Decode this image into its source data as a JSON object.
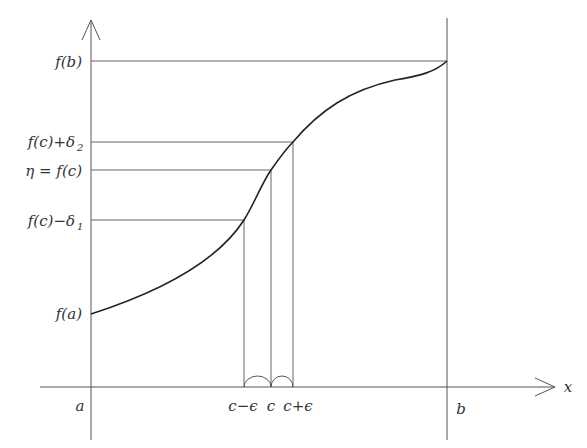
{
  "diagram": {
    "colors": {
      "stroke": "#444444",
      "curve": "#222222",
      "text": "#333333",
      "background": "#ffffff"
    },
    "axes": {
      "x_label": "x",
      "y_arrow": "up"
    },
    "y_labels": {
      "fb": "f(b)",
      "fc_plus": "f(c)+δ",
      "fc_plus_sub": "2",
      "eta": "η = f(c)",
      "fc_minus": "f(c)−δ",
      "fc_minus_sub": "1",
      "fa": "f(a)"
    },
    "x_labels": {
      "a": "a",
      "c_minus": "c−ϵ",
      "c": "c",
      "c_plus": "c+ϵ",
      "b": "b"
    }
  }
}
